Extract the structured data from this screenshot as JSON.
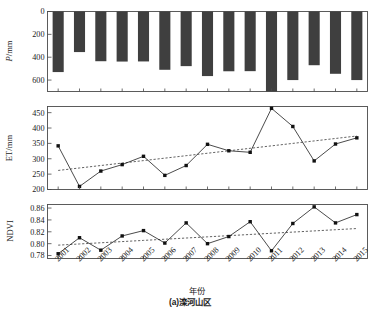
{
  "figure": {
    "caption_axis": "年份",
    "caption_panel": "(a)滦河山区"
  },
  "chart_data": [
    {
      "type": "bar",
      "panel": "top",
      "title": "",
      "xlabel": "年份",
      "ylabel": "P/mm",
      "ylim": [
        700,
        0
      ],
      "y_inverted": true,
      "yticks": [
        0,
        200,
        400,
        600
      ],
      "grid": false,
      "legend": "none",
      "categories": [
        "2001",
        "2002",
        "2003",
        "2004",
        "2005",
        "2006",
        "2007",
        "2008",
        "2009",
        "2010",
        "2011",
        "2012",
        "2013",
        "2014",
        "2015"
      ],
      "values": [
        530,
        355,
        435,
        438,
        437,
        510,
        478,
        565,
        523,
        522,
        700,
        600,
        470,
        545,
        600
      ]
    },
    {
      "type": "line",
      "panel": "middle",
      "title": "",
      "xlabel": "年份",
      "ylabel": "ET/mm",
      "ylim": [
        200,
        470
      ],
      "yticks": [
        200,
        250,
        300,
        350,
        400,
        450
      ],
      "grid": false,
      "legend": "none",
      "x": [
        "2001",
        "2002",
        "2003",
        "2004",
        "2005",
        "2006",
        "2007",
        "2008",
        "2009",
        "2010",
        "2011",
        "2012",
        "2013",
        "2014",
        "2015"
      ],
      "series": [
        {
          "name": "ET",
          "marker": "square",
          "values": [
            342,
            210,
            260,
            281,
            308,
            246,
            278,
            347,
            326,
            321,
            464,
            405,
            293,
            348,
            368
          ]
        },
        {
          "name": "trend",
          "style": "dashed",
          "values": [
            262,
            270,
            278,
            286,
            294,
            302,
            310,
            318,
            326,
            334,
            342,
            350,
            358,
            366,
            374
          ]
        }
      ]
    },
    {
      "type": "line",
      "panel": "bottom",
      "title": "",
      "xlabel": "年份",
      "ylabel": "NDVI",
      "ylim": [
        0.775,
        0.866
      ],
      "yticks": [
        0.78,
        0.8,
        0.82,
        0.84,
        0.86
      ],
      "ytick_labels": [
        "0.78",
        "0.80",
        "0.82",
        "0.84",
        "0.86"
      ],
      "grid": false,
      "legend": "none",
      "x": [
        "2001",
        "2002",
        "2003",
        "2004",
        "2005",
        "2006",
        "2007",
        "2008",
        "2009",
        "2010",
        "2011",
        "2012",
        "2013",
        "2014",
        "2015"
      ],
      "series": [
        {
          "name": "NDVI",
          "marker": "square",
          "values": [
            0.783,
            0.81,
            0.789,
            0.813,
            0.822,
            0.801,
            0.835,
            0.8,
            0.812,
            0.837,
            0.788,
            0.834,
            0.862,
            0.835,
            0.849
          ]
        },
        {
          "name": "trend",
          "style": "dashed",
          "values": [
            0.7975,
            0.7995,
            0.8015,
            0.8035,
            0.8055,
            0.8075,
            0.8095,
            0.8115,
            0.8135,
            0.8155,
            0.8175,
            0.8195,
            0.8215,
            0.8235,
            0.8255
          ]
        }
      ]
    }
  ],
  "axes": {
    "p_label": "P/mm",
    "p_ticks": [
      "0",
      "200",
      "400",
      "600"
    ],
    "et_label": "ET/mm",
    "et_ticks": [
      "200",
      "250",
      "300",
      "350",
      "400",
      "450"
    ],
    "ndvi_label": "NDVI",
    "ndvi_ticks": [
      "0.78",
      "0.80",
      "0.82",
      "0.84",
      "0.86"
    ],
    "years": [
      "2001",
      "2002",
      "2003",
      "2004",
      "2005",
      "2006",
      "2007",
      "2008",
      "2009",
      "2010",
      "2011",
      "2012",
      "2013",
      "2014",
      "2015"
    ]
  }
}
